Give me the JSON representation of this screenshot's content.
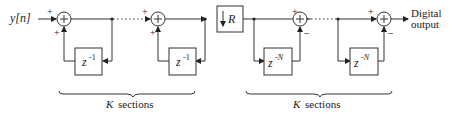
{
  "diagram": {
    "input_label": "y[n]",
    "output_label_line1": "Digital",
    "output_label_line2": "output",
    "integrator_delay": "z",
    "integrator_delay_exp": "-1",
    "comb_delay": "z",
    "comb_delay_exp": "-N",
    "decimator_label": "R",
    "plus": "+",
    "minus": "–",
    "section1_k": "K",
    "section1_text": "sections",
    "section2_k": "K",
    "section2_text": "sections"
  }
}
